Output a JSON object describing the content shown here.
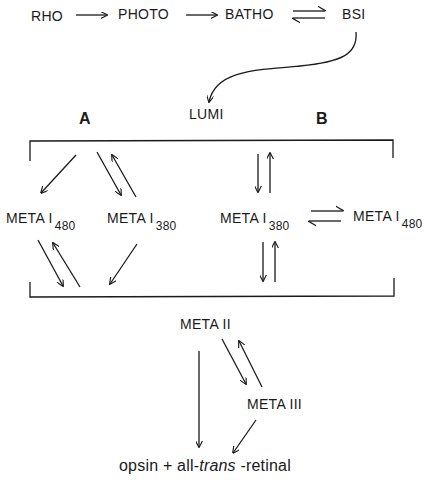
{
  "diagram": {
    "top_row": {
      "rho": "RHO",
      "photo": "PHOTO",
      "batho": "BATHO",
      "bsi": "BSI"
    },
    "lumi": "LUMI",
    "pathway_a_label": "A",
    "pathway_b_label": "B",
    "pathway_a": {
      "meta1_480": {
        "prefix": "META I",
        "sub": "480"
      },
      "meta1_380": {
        "prefix": "META I",
        "sub": "380"
      }
    },
    "pathway_b": {
      "meta1_380": {
        "prefix": "META I",
        "sub": "380"
      },
      "meta1_480": {
        "prefix": "META I",
        "sub": "480"
      }
    },
    "meta2": "META II",
    "meta3": "META III",
    "products": {
      "part1": "opsin + all-",
      "italic": "trans",
      "part2": " -retinal"
    },
    "edges": [
      {
        "from": "RHO",
        "to": "PHOTO",
        "type": "forward"
      },
      {
        "from": "PHOTO",
        "to": "BATHO",
        "type": "forward"
      },
      {
        "from": "BATHO",
        "to": "BSI",
        "type": "equilibrium"
      },
      {
        "from": "BSI",
        "to": "LUMI",
        "type": "forward"
      },
      {
        "from": "LUMI",
        "to": "META I480 (A)",
        "type": "forward"
      },
      {
        "from": "LUMI",
        "to": "META I380 (A)",
        "type": "equilibrium"
      },
      {
        "from": "META I480 (A)",
        "to": "META II",
        "type": "equilibrium"
      },
      {
        "from": "META I380 (A)",
        "to": "META II",
        "type": "forward"
      },
      {
        "from": "LUMI",
        "to": "META I380 (B)",
        "type": "equilibrium"
      },
      {
        "from": "META I380 (B)",
        "to": "META I480 (B)",
        "type": "equilibrium"
      },
      {
        "from": "META I380 (B)",
        "to": "META II",
        "type": "equilibrium"
      },
      {
        "from": "META II",
        "to": "META III",
        "type": "equilibrium"
      },
      {
        "from": "META II",
        "to": "opsin + all-trans-retinal",
        "type": "forward"
      },
      {
        "from": "META III",
        "to": "opsin + all-trans-retinal",
        "type": "forward"
      }
    ]
  }
}
